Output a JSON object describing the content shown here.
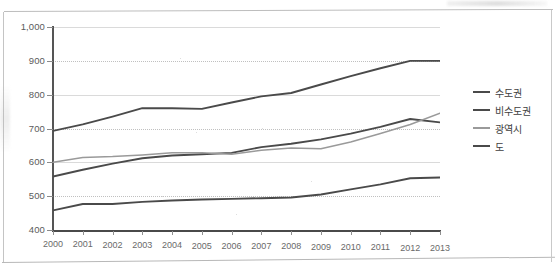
{
  "chart_data": {
    "type": "line",
    "title": "",
    "subtitle": "",
    "xlabel": "",
    "ylabel": "",
    "x": [
      2000,
      2001,
      2002,
      2003,
      2004,
      2005,
      2006,
      2007,
      2008,
      2009,
      2010,
      2011,
      2012,
      2013
    ],
    "categories": [
      "2000",
      "2001",
      "2002",
      "2003",
      "2004",
      "2005",
      "2006",
      "2007",
      "2008",
      "2009",
      "2010",
      "2011",
      "2012",
      "2013"
    ],
    "xlim": [
      2000,
      2013
    ],
    "ylim": [
      400,
      1000
    ],
    "yticks": [
      400,
      500,
      600,
      700,
      800,
      900,
      1000
    ],
    "ytick_labels": [
      "400",
      "500",
      "600",
      "700",
      "800",
      "900",
      "1,000"
    ],
    "grid": true,
    "grid_axis": "y",
    "grid_style": "dotted",
    "legend_position": "right",
    "series": [
      {
        "name": "수도권",
        "color": "#4a4a4a",
        "values": [
          693,
          712,
          735,
          760,
          760,
          758,
          777,
          795,
          805,
          830,
          855,
          878,
          900,
          900
        ]
      },
      {
        "name": "비수도권",
        "color": "#4a4a4a",
        "values": [
          558,
          578,
          596,
          612,
          620,
          624,
          628,
          645,
          655,
          668,
          685,
          705,
          728,
          718
        ]
      },
      {
        "name": "광역시",
        "color": "#9a9a9a",
        "values": [
          600,
          614,
          617,
          622,
          628,
          628,
          624,
          636,
          642,
          640,
          660,
          685,
          712,
          745
        ]
      },
      {
        "name": "도",
        "color": "#4a4a4a",
        "values": [
          458,
          477,
          477,
          483,
          487,
          490,
          492,
          494,
          496,
          505,
          520,
          535,
          553,
          555
        ]
      }
    ]
  },
  "legend": {
    "items": [
      {
        "label": "수도권",
        "color": "#4a4a4a"
      },
      {
        "label": "비수도권",
        "color": "#4a4a4a"
      },
      {
        "label": "광역시",
        "color": "#9a9a9a"
      },
      {
        "label": "도",
        "color": "#4a4a4a"
      }
    ]
  },
  "colors": {
    "axis": "#4a4a4a",
    "grid": "#c0c0c0",
    "tick_label": "#5b5b5b",
    "frame": "#c4c4c4",
    "background": "#ffffff"
  }
}
